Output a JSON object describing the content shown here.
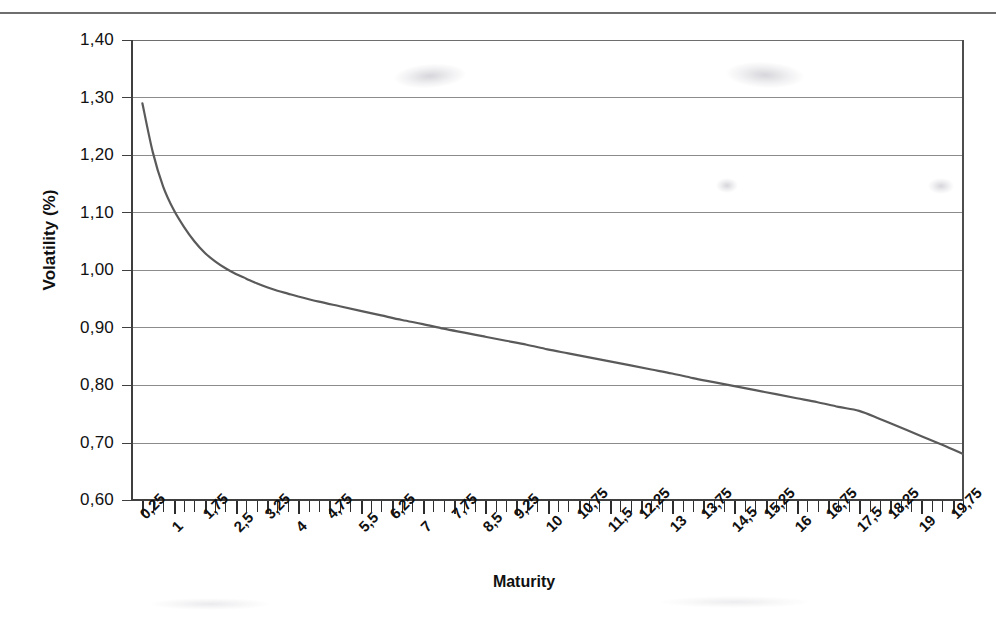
{
  "page": {
    "background": "#ffffff",
    "rule_color": "#4a4a4a"
  },
  "chart_data": {
    "type": "line",
    "title": "",
    "subtitle": "",
    "xlabel": "Maturity",
    "ylabel": "Volatility (%)",
    "xlim": [
      0,
      20
    ],
    "ylim": [
      0.6,
      1.4
    ],
    "grid": true,
    "grid_axis": "y",
    "legend": false,
    "legend_position": "none",
    "decimal_separator": ",",
    "line_color": "#5a5a5a",
    "line_width": 2.2,
    "y_ticks": [
      1.4,
      1.3,
      1.2,
      1.1,
      1.0,
      0.9,
      0.8,
      0.7,
      0.6
    ],
    "y_tick_labels": [
      "1,40",
      "1,30",
      "1,20",
      "1,10",
      "1,00",
      "0,90",
      "0,80",
      "0,70",
      "0,60"
    ],
    "x_ticks": [
      0.25,
      1,
      1.75,
      2.5,
      3.25,
      4,
      4.75,
      5.5,
      6.25,
      7,
      7.75,
      8.5,
      9.25,
      10,
      10.75,
      11.5,
      12.25,
      13,
      13.75,
      14.5,
      15.25,
      16,
      16.75,
      17.5,
      18.25,
      19,
      19.75
    ],
    "x_tick_labels": [
      "0,25",
      "1",
      "1,75",
      "2,5",
      "3,25",
      "4",
      "4,75",
      "5,5",
      "6,25",
      "7",
      "7,75",
      "8,5",
      "9,25",
      "10",
      "10,75",
      "11,5",
      "12,25",
      "13",
      "13,75",
      "14,5",
      "15,25",
      "16",
      "16,75",
      "17,5",
      "18,25",
      "19",
      "19,75"
    ],
    "minor_tick_interval": 0.25,
    "series": [
      {
        "name": "Volatility term structure",
        "x": [
          0.25,
          0.5,
          0.75,
          1.0,
          1.25,
          1.5,
          1.75,
          2.0,
          2.25,
          2.5,
          2.75,
          3.0,
          3.25,
          3.5,
          3.75,
          4.0,
          4.5,
          5.0,
          5.5,
          6.0,
          6.5,
          7.0,
          7.5,
          8.0,
          8.5,
          9.0,
          9.5,
          10.0,
          10.5,
          11.0,
          11.5,
          12.0,
          12.5,
          13.0,
          13.5,
          14.0,
          14.5,
          15.0,
          15.5,
          16.0,
          16.5,
          17.0,
          17.5,
          18.0,
          18.5,
          19.0,
          19.5,
          20.0
        ],
        "y": [
          1.29,
          1.205,
          1.145,
          1.105,
          1.075,
          1.05,
          1.03,
          1.015,
          1.003,
          0.993,
          0.985,
          0.977,
          0.97,
          0.964,
          0.959,
          0.954,
          0.945,
          0.937,
          0.929,
          0.921,
          0.913,
          0.906,
          0.898,
          0.891,
          0.884,
          0.877,
          0.87,
          0.862,
          0.855,
          0.848,
          0.841,
          0.834,
          0.827,
          0.82,
          0.812,
          0.805,
          0.798,
          0.791,
          0.784,
          0.777,
          0.77,
          0.762,
          0.755,
          0.741,
          0.726,
          0.711,
          0.696,
          0.68
        ]
      }
    ],
    "annotations": []
  },
  "axes": {
    "y_title": "Volatility (%)",
    "x_title": "Maturity"
  }
}
